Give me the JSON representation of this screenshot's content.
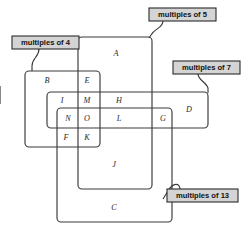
{
  "diagram": {
    "type": "venn",
    "background_color": "#ffffff",
    "stroke_color": "#3a3a3a",
    "callout_fill": "#d4d4d4",
    "callout_border": "#2b2b2b",
    "sets": [
      {
        "id": "multiples-of-4",
        "label": "multiples of 4",
        "rect": {
          "x": 25,
          "y": 71,
          "w": 75,
          "h": 76
        },
        "callout": {
          "x": 12,
          "y": 36,
          "w": 67,
          "h": 13
        }
      },
      {
        "id": "multiples-of-5",
        "label": "multiples of 5",
        "rect": {
          "x": 78,
          "y": 37,
          "w": 74,
          "h": 152
        },
        "callout": {
          "x": 149,
          "y": 8,
          "w": 67,
          "h": 13
        }
      },
      {
        "id": "multiples-of-7",
        "label": "multiples of 7",
        "rect": {
          "x": 47,
          "y": 92,
          "w": 161,
          "h": 36
        },
        "callout": {
          "x": 173,
          "y": 61,
          "w": 67,
          "h": 13
        }
      },
      {
        "id": "multiples-of-13",
        "label": "multiples of 13",
        "rect": {
          "x": 57,
          "y": 108,
          "w": 115,
          "h": 114
        },
        "callout": {
          "x": 167,
          "y": 189,
          "w": 71,
          "h": 13
        }
      }
    ],
    "regions": [
      {
        "id": "region-a",
        "label": "A",
        "x": 116,
        "y": 54,
        "sets": [
          "multiples-of-5"
        ]
      },
      {
        "id": "region-b",
        "label": "B",
        "x": 47,
        "y": 81,
        "sets": [
          "multiples-of-4"
        ]
      },
      {
        "id": "region-e",
        "label": "E",
        "x": 87,
        "y": 81,
        "sets": [
          "multiples-of-4",
          "multiples-of-5"
        ]
      },
      {
        "id": "region-i",
        "label": "I",
        "x": 62,
        "y": 101,
        "sets": [
          "multiples-of-4",
          "multiples-of-7"
        ]
      },
      {
        "id": "region-m",
        "label": "M",
        "x": 87,
        "y": 101,
        "sets": [
          "multiples-of-4",
          "multiples-of-5",
          "multiples-of-7"
        ]
      },
      {
        "id": "region-h",
        "label": "H",
        "x": 119,
        "y": 101,
        "sets": [
          "multiples-of-5",
          "multiples-of-7"
        ]
      },
      {
        "id": "region-d",
        "label": "D",
        "x": 189,
        "y": 110,
        "sets": [
          "multiples-of-7"
        ]
      },
      {
        "id": "region-n",
        "label": "N",
        "x": 68,
        "y": 119,
        "sets": [
          "multiples-of-4",
          "multiples-of-7",
          "multiples-of-13"
        ]
      },
      {
        "id": "region-o",
        "label": "O",
        "x": 87,
        "y": 119,
        "sets": [
          "multiples-of-4",
          "multiples-of-5",
          "multiples-of-7",
          "multiples-of-13"
        ]
      },
      {
        "id": "region-l",
        "label": "L",
        "x": 119,
        "y": 119,
        "sets": [
          "multiples-of-5",
          "multiples-of-7",
          "multiples-of-13"
        ]
      },
      {
        "id": "region-g",
        "label": "G",
        "x": 163,
        "y": 119,
        "sets": [
          "multiples-of-7",
          "multiples-of-13"
        ]
      },
      {
        "id": "region-f",
        "label": "F",
        "x": 66,
        "y": 138,
        "sets": [
          "multiples-of-4",
          "multiples-of-13"
        ]
      },
      {
        "id": "region-k",
        "label": "K",
        "x": 87,
        "y": 138,
        "sets": [
          "multiples-of-4",
          "multiples-of-5",
          "multiples-of-13"
        ]
      },
      {
        "id": "region-j",
        "label": "J",
        "x": 114,
        "y": 165,
        "sets": [
          "multiples-of-5",
          "multiples-of-13"
        ]
      },
      {
        "id": "region-c",
        "label": "C",
        "x": 114,
        "y": 208,
        "sets": [
          "multiples-of-13"
        ]
      }
    ]
  }
}
